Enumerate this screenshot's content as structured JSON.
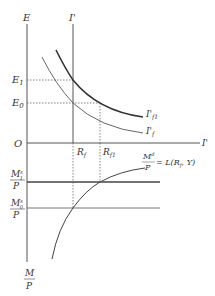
{
  "diagram": {
    "type": "economics-two-panel",
    "upper_panel": {
      "y_axis_label": "E",
      "x_axis_label": "I'",
      "origin_label": "O",
      "vertical_line_label": "I'",
      "y_levels": [
        {
          "label": "E",
          "sub": "1",
          "y": 80
        },
        {
          "label": "E",
          "sub": "0",
          "y": 103
        }
      ],
      "curves": [
        {
          "name": "I'f1",
          "label_main": "I'",
          "label_sub": "f1",
          "weight": "thick"
        },
        {
          "name": "I'f",
          "label_main": "I'",
          "label_sub": "f",
          "weight": "thin"
        }
      ]
    },
    "x_markers": [
      {
        "label": "R",
        "sub": "f",
        "x": 73
      },
      {
        "label": "R",
        "sub": "f1",
        "x": 100
      }
    ],
    "lower_panel": {
      "y_axis_label_num": "M",
      "y_axis_label_den": "P",
      "levels": [
        {
          "num": "M",
          "num_sup": "s",
          "num_sub": "1",
          "den": "P",
          "y": 182,
          "weight": "thick"
        },
        {
          "num": "M",
          "num_sup": "s",
          "num_sub": "0",
          "den": "P",
          "y": 208,
          "weight": "thin"
        }
      ],
      "demand_curve": {
        "num": "M",
        "num_sup": "d",
        "den": "P",
        "equation": "= L(R",
        "eq_sub": "f",
        "eq_tail": ", Y)"
      }
    }
  }
}
